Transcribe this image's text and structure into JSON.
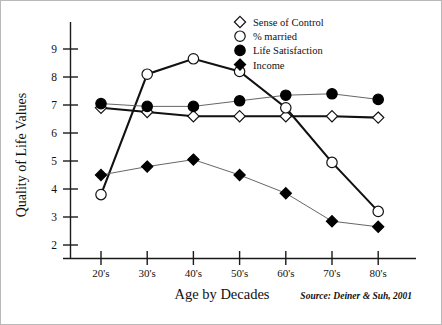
{
  "figure": {
    "y_axis_title": "Quality of Life Values",
    "x_axis_title": "Age by Decades",
    "source_note": "Source: Deiner & Suh, 2001",
    "border_color": "#b9b9b9",
    "background": "#ffffff"
  },
  "legend": {
    "position": "top-right",
    "items": [
      {
        "label": "Sense of Control",
        "marker": "open-diamond-icon",
        "color": "#111111"
      },
      {
        "label": "% married",
        "marker": "open-circle-icon",
        "color": "#111111"
      },
      {
        "label": "Life Satisfaction",
        "marker": "filled-circle-icon",
        "color": "#000000"
      },
      {
        "label": "Income",
        "marker": "filled-diamond-icon",
        "color": "#000000"
      }
    ]
  },
  "chart_data": {
    "type": "line",
    "title": "",
    "xlabel": "Age by Decades",
    "ylabel": "Quality of Life Values",
    "categories": [
      "20's",
      "30's",
      "40's",
      "50's",
      "60's",
      "70's",
      "80's"
    ],
    "ytick_labels": [
      "2",
      "3",
      "4",
      "5",
      "6",
      "7",
      "8",
      "9"
    ],
    "yticks": [
      2,
      3,
      4,
      5,
      6,
      7,
      8,
      9
    ],
    "ylim": [
      1.3,
      9.6
    ],
    "grid": false,
    "legend_position": "top-right",
    "annotations": [
      "Source: Deiner & Suh, 2001"
    ],
    "series": [
      {
        "name": "Sense of Control",
        "marker": "open-diamond",
        "values": [
          6.9,
          6.75,
          6.6,
          6.6,
          6.6,
          6.6,
          6.55
        ]
      },
      {
        "name": "% married",
        "marker": "open-circle",
        "values": [
          3.8,
          8.1,
          8.65,
          8.2,
          6.9,
          4.95,
          3.2
        ]
      },
      {
        "name": "Life Satisfaction",
        "marker": "filled-circle",
        "values": [
          7.05,
          6.95,
          6.95,
          7.15,
          7.35,
          7.4,
          7.2
        ]
      },
      {
        "name": "Income",
        "marker": "filled-diamond",
        "values": [
          4.5,
          4.8,
          5.05,
          4.5,
          3.85,
          2.85,
          2.65
        ]
      }
    ]
  }
}
